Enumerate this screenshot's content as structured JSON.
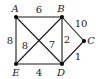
{
  "diagram": {
    "type": "weighted-undirected-graph",
    "nodes": [
      {
        "id": "A",
        "label": "A",
        "x": 16,
        "y": 17,
        "lx": 15,
        "ly": 12
      },
      {
        "id": "B",
        "label": "B",
        "x": 62,
        "y": 17,
        "lx": 61,
        "ly": 12
      },
      {
        "id": "C",
        "label": "C",
        "x": 84,
        "y": 41,
        "lx": 91,
        "ly": 44
      },
      {
        "id": "D",
        "label": "D",
        "x": 62,
        "y": 64,
        "lx": 61,
        "ly": 76
      },
      {
        "id": "E",
        "label": "E",
        "x": 16,
        "y": 64,
        "lx": 16,
        "ly": 76
      }
    ],
    "edges": [
      {
        "from": "A",
        "to": "B",
        "weight": "6",
        "lx": 39,
        "ly": 13
      },
      {
        "from": "A",
        "to": "E",
        "weight": "8",
        "lx": 10,
        "ly": 44
      },
      {
        "from": "A",
        "to": "D",
        "weight": "7",
        "lx": 52,
        "ly": 48
      },
      {
        "from": "E",
        "to": "B",
        "weight": "8",
        "lx": 25,
        "ly": 49
      },
      {
        "from": "B",
        "to": "D",
        "weight": "2",
        "lx": 67,
        "ly": 43
      },
      {
        "from": "B",
        "to": "C",
        "weight": "10",
        "lx": 81,
        "ly": 27
      },
      {
        "from": "D",
        "to": "C",
        "weight": "1",
        "lx": 78,
        "ly": 60
      },
      {
        "from": "E",
        "to": "D",
        "weight": "4",
        "lx": 39,
        "ly": 76
      }
    ]
  }
}
